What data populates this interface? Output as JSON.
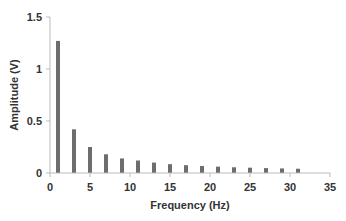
{
  "chart_data": {
    "type": "bar",
    "title": "",
    "xlabel": "Frequency (Hz)",
    "ylabel": "Amplitude (V)",
    "xlim": [
      0,
      35
    ],
    "ylim": [
      0,
      1.5
    ],
    "xticks": [
      0,
      5,
      10,
      15,
      20,
      25,
      30,
      35
    ],
    "yticks": [
      0,
      0.5,
      1,
      1.5
    ],
    "ytick_labels": [
      "0",
      "0.5",
      "1",
      "1.5"
    ],
    "grid": false,
    "legend": null,
    "bar_color": "#6d6d6d",
    "x": [
      1,
      3,
      5,
      7,
      9,
      11,
      13,
      15,
      17,
      19,
      21,
      23,
      25,
      27,
      29,
      31
    ],
    "values": [
      1.27,
      0.42,
      0.25,
      0.18,
      0.14,
      0.12,
      0.1,
      0.085,
      0.075,
      0.067,
      0.061,
      0.055,
      0.051,
      0.047,
      0.044,
      0.041
    ]
  }
}
